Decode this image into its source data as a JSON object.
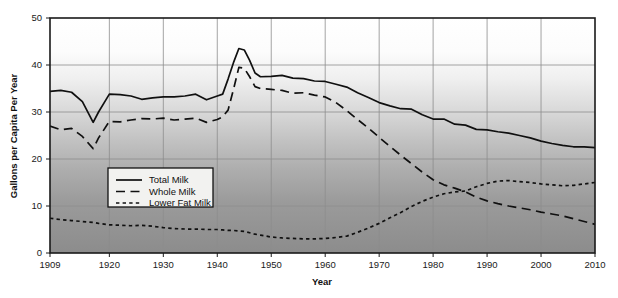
{
  "chart_data": {
    "type": "line",
    "title": "",
    "xlabel": "Year",
    "ylabel": "Gallons per Capita Per Year",
    "xlim": [
      1909,
      2010
    ],
    "ylim": [
      0,
      50
    ],
    "grid": true,
    "legend_position": "inside-left-lower",
    "x_ticks": [
      "1909",
      "1920",
      "1930",
      "1940",
      "1950",
      "1960",
      "1970",
      "1980",
      "1990",
      "2000",
      "2010"
    ],
    "x_tick_values": [
      1909,
      1920,
      1930,
      1940,
      1950,
      1960,
      1970,
      1980,
      1990,
      2000,
      2010
    ],
    "y_ticks": [
      "0",
      "10",
      "20",
      "30",
      "40",
      "50"
    ],
    "y_tick_values": [
      0,
      10,
      20,
      30,
      40,
      50
    ],
    "x": [
      1909,
      1911,
      1913,
      1915,
      1917,
      1918,
      1920,
      1922,
      1924,
      1926,
      1928,
      1930,
      1932,
      1934,
      1936,
      1938,
      1940,
      1941,
      1942,
      1943,
      1944,
      1945,
      1946,
      1947,
      1948,
      1950,
      1952,
      1954,
      1956,
      1958,
      1960,
      1962,
      1964,
      1966,
      1968,
      1970,
      1972,
      1974,
      1976,
      1978,
      1980,
      1982,
      1984,
      1986,
      1988,
      1990,
      1992,
      1994,
      1996,
      1998,
      2000,
      2002,
      2004,
      2006,
      2008,
      2010
    ],
    "series": [
      {
        "name": "Total Milk",
        "style": "solid",
        "values": [
          34.4,
          34.6,
          34.2,
          32.2,
          27.8,
          30.0,
          33.8,
          33.7,
          33.4,
          32.7,
          33.0,
          33.2,
          33.2,
          33.4,
          33.8,
          32.6,
          33.4,
          33.8,
          37.0,
          40.5,
          43.5,
          43.2,
          41.0,
          38.3,
          37.5,
          37.6,
          37.8,
          37.2,
          37.1,
          36.6,
          36.5,
          35.9,
          35.3,
          34.1,
          33.1,
          32.0,
          31.3,
          30.7,
          30.6,
          29.4,
          28.5,
          28.5,
          27.4,
          27.2,
          26.3,
          26.2,
          25.8,
          25.5,
          25.0,
          24.5,
          23.8,
          23.3,
          22.9,
          22.6,
          22.6,
          22.4
        ]
      },
      {
        "name": "Whole Milk",
        "style": "dashed-long",
        "values": [
          27.0,
          26.2,
          26.5,
          24.8,
          22.2,
          24.5,
          28.0,
          27.9,
          28.3,
          28.6,
          28.5,
          28.7,
          28.3,
          28.5,
          28.7,
          27.8,
          28.4,
          29.0,
          30.4,
          34.8,
          39.5,
          39.3,
          37.5,
          35.4,
          35.0,
          34.8,
          34.6,
          34.0,
          34.1,
          33.6,
          33.2,
          32.0,
          30.3,
          28.4,
          26.6,
          24.6,
          22.7,
          20.8,
          19.0,
          17.2,
          15.6,
          14.5,
          13.8,
          13.0,
          11.9,
          11.1,
          10.5,
          10.0,
          9.6,
          9.2,
          8.7,
          8.3,
          7.9,
          7.3,
          6.7,
          6.1
        ]
      },
      {
        "name": "Lower Fat Milk",
        "style": "dashed-short",
        "values": [
          7.4,
          7.1,
          6.9,
          6.7,
          6.5,
          6.3,
          6.0,
          5.9,
          5.8,
          5.9,
          5.7,
          5.4,
          5.2,
          5.1,
          5.1,
          5.0,
          5.0,
          4.9,
          4.8,
          4.8,
          4.7,
          4.6,
          4.3,
          4.0,
          3.8,
          3.4,
          3.2,
          3.1,
          3.0,
          3.0,
          3.1,
          3.3,
          3.6,
          4.4,
          5.3,
          6.3,
          7.5,
          8.6,
          9.9,
          11.0,
          11.9,
          12.6,
          13.0,
          13.2,
          14.1,
          14.8,
          15.3,
          15.4,
          15.2,
          15.0,
          14.7,
          14.5,
          14.3,
          14.4,
          14.7,
          15.0
        ]
      }
    ],
    "legend_entries": [
      {
        "label": "Total Milk",
        "style": "solid"
      },
      {
        "label": "Whole Milk",
        "style": "dashed-long"
      },
      {
        "label": "Lower Fat Milk",
        "style": "dashed-short"
      }
    ],
    "colors": {
      "line": "#101010",
      "frame": "#1a1a1a",
      "grid": "#8d8d8d",
      "plot_bg_top": "#ffffff",
      "plot_bg_bottom": "#8e8e8e",
      "legend_bg": "#f2f2f0",
      "page_bg": "#ffffff"
    }
  }
}
